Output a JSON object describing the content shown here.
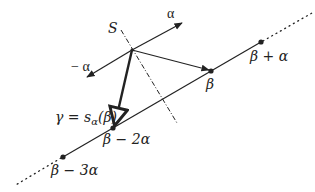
{
  "diagram": {
    "colors": {
      "ink": "#222222",
      "background": "#ffffff"
    },
    "labels": {
      "hyperplane": "S",
      "alpha": "α",
      "neg_alpha": "− α",
      "beta": "β",
      "beta_plus_alpha": "β + α",
      "beta_minus_2alpha": "β − 2α",
      "beta_minus_3alpha": "β − 3α",
      "gamma": "γ = s",
      "gamma_sub": "α",
      "gamma_arg": "(β)"
    },
    "points": {
      "origin": [
        132,
        50
      ],
      "alpha_tip": [
        182,
        23
      ],
      "neg_alpha_tip": [
        87,
        77
      ],
      "beta": [
        211,
        71
      ],
      "beta_plus_alpha": [
        261,
        42
      ],
      "beta_minus_2alpha": [
        113,
        128
      ],
      "beta_minus_3alpha": [
        63,
        157
      ]
    }
  }
}
